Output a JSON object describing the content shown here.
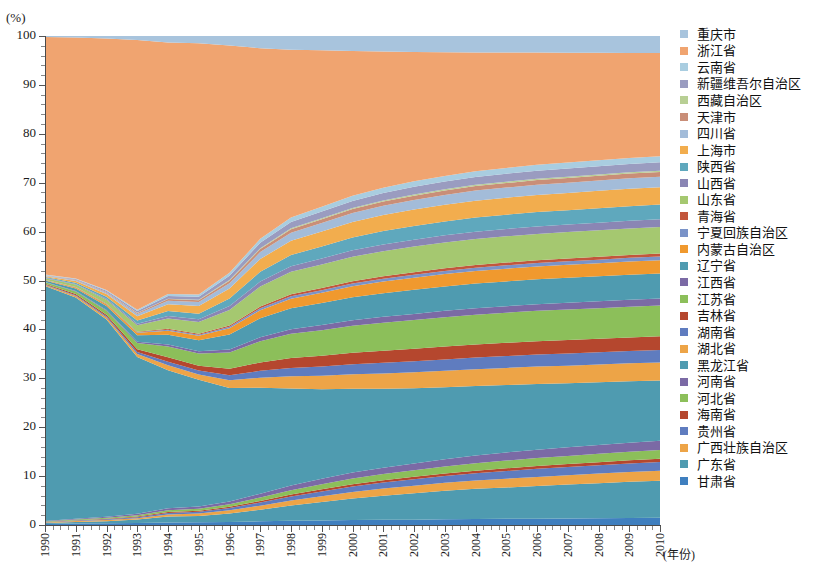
{
  "chart_data": {
    "type": "area",
    "title": "",
    "xlabel": "(年份)",
    "ylabel": "(%)",
    "ylim": [
      0,
      100
    ],
    "xlim": [
      1990,
      2010
    ],
    "ytick_labels": [
      "0",
      "10",
      "20",
      "30",
      "40",
      "50",
      "60",
      "70",
      "80",
      "90",
      "100"
    ],
    "ytick_values": [
      0,
      10,
      20,
      30,
      40,
      50,
      60,
      70,
      80,
      90,
      100
    ],
    "grid": false,
    "legend_position": "right",
    "stack_mode": "percent",
    "x": [
      1990,
      1991,
      1992,
      1993,
      1994,
      1995,
      1996,
      1997,
      1998,
      1999,
      2000,
      2001,
      2002,
      2003,
      2004,
      2005,
      2006,
      2007,
      2008,
      2009,
      2010
    ],
    "palette": [
      "#4f9bb0",
      "#7b6aa5",
      "#8cbf5a",
      "#b5472e",
      "#5f7cbf",
      "#eda447"
    ],
    "series": [
      {
        "name": "甘肃省",
        "values": [
          0.2,
          0.3,
          0.35,
          0.4,
          0.5,
          0.55,
          0.6,
          0.7,
          0.8,
          0.9,
          1.0,
          1.05,
          1.1,
          1.2,
          1.25,
          1.3,
          1.35,
          1.4,
          1.45,
          1.5,
          1.55
        ]
      },
      {
        "name": "广东省",
        "values": [
          0.2,
          0.3,
          0.4,
          0.7,
          1.2,
          1.3,
          1.7,
          2.2,
          2.9,
          3.6,
          4.3,
          4.9,
          5.4,
          5.9,
          6.3,
          6.6,
          6.9,
          7.2,
          7.5,
          7.8,
          8.0
        ]
      },
      {
        "name": "广西壮族自治区",
        "values": [
          0.1,
          0.2,
          0.25,
          0.3,
          0.45,
          0.5,
          0.6,
          0.75,
          0.95,
          1.1,
          1.3,
          1.45,
          1.55,
          1.65,
          1.75,
          1.85,
          1.95,
          2.0,
          2.05,
          2.1,
          2.15
        ]
      },
      {
        "name": "贵州省",
        "values": [
          0.05,
          0.1,
          0.15,
          0.2,
          0.3,
          0.35,
          0.45,
          0.6,
          0.8,
          0.95,
          1.1,
          1.2,
          1.3,
          1.4,
          1.5,
          1.6,
          1.7,
          1.75,
          1.8,
          1.85,
          1.9
        ]
      },
      {
        "name": "海南省",
        "values": [
          0.05,
          0.08,
          0.1,
          0.15,
          0.2,
          0.22,
          0.25,
          0.3,
          0.35,
          0.4,
          0.45,
          0.48,
          0.5,
          0.52,
          0.55,
          0.58,
          0.6,
          0.62,
          0.64,
          0.66,
          0.68
        ]
      },
      {
        "name": "河北省",
        "values": [
          0.1,
          0.15,
          0.2,
          0.25,
          0.35,
          0.4,
          0.5,
          0.65,
          0.85,
          1.0,
          1.15,
          1.25,
          1.35,
          1.45,
          1.55,
          1.65,
          1.7,
          1.75,
          1.8,
          1.85,
          1.9
        ]
      },
      {
        "name": "河南省",
        "values": [
          0.1,
          0.15,
          0.2,
          0.28,
          0.4,
          0.45,
          0.55,
          0.7,
          0.9,
          1.05,
          1.2,
          1.3,
          1.4,
          1.5,
          1.6,
          1.7,
          1.78,
          1.85,
          1.9,
          1.95,
          2.0
        ]
      },
      {
        "name": "黑龙江省",
        "values": [
          48.0,
          45.0,
          40.0,
          32.0,
          28.0,
          26.0,
          22.5,
          20.0,
          18.5,
          17.5,
          16.8,
          16.0,
          15.4,
          14.9,
          14.5,
          14.2,
          13.9,
          13.6,
          13.4,
          13.2,
          13.0
        ]
      },
      {
        "name": "湖北省",
        "values": [
          0.2,
          0.3,
          0.4,
          0.6,
          1.0,
          1.1,
          1.5,
          1.9,
          2.3,
          2.6,
          2.9,
          3.1,
          3.25,
          3.4,
          3.5,
          3.6,
          3.7,
          3.75,
          3.8,
          3.85,
          3.9
        ]
      },
      {
        "name": "湖南省",
        "values": [
          0.1,
          0.15,
          0.25,
          0.4,
          0.7,
          0.8,
          1.0,
          1.3,
          1.6,
          1.8,
          2.0,
          2.15,
          2.25,
          2.35,
          2.45,
          2.5,
          2.55,
          2.6,
          2.62,
          2.65,
          2.68
        ]
      },
      {
        "name": "吉林省",
        "values": [
          0.15,
          0.25,
          0.35,
          0.55,
          0.9,
          1.0,
          1.3,
          1.6,
          1.9,
          2.1,
          2.3,
          2.45,
          2.55,
          2.65,
          2.72,
          2.78,
          2.82,
          2.86,
          2.9,
          2.93,
          2.95
        ]
      },
      {
        "name": "江苏省",
        "values": [
          0.3,
          0.5,
          0.8,
          1.3,
          2.2,
          2.5,
          3.2,
          4.0,
          4.6,
          5.0,
          5.4,
          5.7,
          5.9,
          6.1,
          6.25,
          6.35,
          6.45,
          6.5,
          6.55,
          6.6,
          6.65
        ]
      },
      {
        "name": "江西省",
        "values": [
          0.05,
          0.1,
          0.15,
          0.25,
          0.4,
          0.45,
          0.6,
          0.75,
          0.9,
          1.0,
          1.1,
          1.18,
          1.24,
          1.3,
          1.35,
          1.38,
          1.42,
          1.45,
          1.47,
          1.49,
          1.5
        ]
      },
      {
        "name": "辽宁省",
        "values": [
          0.3,
          0.5,
          0.8,
          1.3,
          2.0,
          2.3,
          3.0,
          3.6,
          4.0,
          4.3,
          4.6,
          4.8,
          4.95,
          5.05,
          5.15,
          5.22,
          5.28,
          5.32,
          5.36,
          5.4,
          5.42
        ]
      },
      {
        "name": "内蒙古自治区",
        "values": [
          0.1,
          0.2,
          0.3,
          0.5,
          0.8,
          0.9,
          1.2,
          1.5,
          1.8,
          2.0,
          2.2,
          2.35,
          2.45,
          2.55,
          2.62,
          2.68,
          2.72,
          2.76,
          2.8,
          2.83,
          2.85
        ]
      },
      {
        "name": "宁夏回族自治区",
        "values": [
          0.03,
          0.05,
          0.08,
          0.12,
          0.2,
          0.22,
          0.3,
          0.38,
          0.45,
          0.5,
          0.55,
          0.58,
          0.62,
          0.65,
          0.68,
          0.7,
          0.72,
          0.74,
          0.76,
          0.78,
          0.8
        ]
      },
      {
        "name": "青海省",
        "values": [
          0.03,
          0.05,
          0.08,
          0.12,
          0.18,
          0.2,
          0.26,
          0.32,
          0.38,
          0.42,
          0.46,
          0.49,
          0.52,
          0.54,
          0.56,
          0.58,
          0.6,
          0.61,
          0.62,
          0.63,
          0.64
        ]
      },
      {
        "name": "山东省",
        "values": [
          0.3,
          0.5,
          0.8,
          1.3,
          2.1,
          2.4,
          3.1,
          3.8,
          4.3,
          4.6,
          4.9,
          5.1,
          5.25,
          5.35,
          5.45,
          5.52,
          5.58,
          5.62,
          5.66,
          5.7,
          5.72
        ]
      },
      {
        "name": "山西省",
        "values": [
          0.08,
          0.12,
          0.2,
          0.32,
          0.5,
          0.55,
          0.75,
          0.92,
          1.08,
          1.18,
          1.28,
          1.36,
          1.42,
          1.48,
          1.52,
          1.55,
          1.58,
          1.6,
          1.62,
          1.64,
          1.65
        ]
      },
      {
        "name": "陕西省",
        "values": [
          0.15,
          0.25,
          0.4,
          0.65,
          1.0,
          1.15,
          1.5,
          1.85,
          2.15,
          2.35,
          2.55,
          2.7,
          2.8,
          2.88,
          2.95,
          3.0,
          3.05,
          3.08,
          3.12,
          3.15,
          3.18
        ]
      },
      {
        "name": "上海市",
        "values": [
          0.2,
          0.35,
          0.55,
          0.9,
          1.4,
          1.6,
          2.0,
          2.4,
          2.7,
          2.9,
          3.1,
          3.25,
          3.35,
          3.45,
          3.52,
          3.58,
          3.62,
          3.66,
          3.7,
          3.73,
          3.75
        ]
      },
      {
        "name": "四川省",
        "values": [
          0.1,
          0.18,
          0.28,
          0.45,
          0.7,
          0.8,
          1.05,
          1.3,
          1.52,
          1.66,
          1.8,
          1.9,
          1.98,
          2.04,
          2.1,
          2.14,
          2.18,
          2.2,
          2.23,
          2.25,
          2.27
        ]
      },
      {
        "name": "天津市",
        "values": [
          0.05,
          0.08,
          0.13,
          0.2,
          0.32,
          0.36,
          0.48,
          0.58,
          0.68,
          0.74,
          0.8,
          0.85,
          0.88,
          0.91,
          0.94,
          0.96,
          0.98,
          0.99,
          1.0,
          1.01,
          1.02
        ]
      },
      {
        "name": "西藏自治区",
        "values": [
          0.02,
          0.03,
          0.04,
          0.06,
          0.09,
          0.1,
          0.13,
          0.16,
          0.18,
          0.2,
          0.22,
          0.23,
          0.24,
          0.25,
          0.26,
          0.27,
          0.27,
          0.28,
          0.28,
          0.29,
          0.29
        ]
      },
      {
        "name": "新疆维吾尔自治区",
        "values": [
          0.08,
          0.14,
          0.22,
          0.36,
          0.56,
          0.64,
          0.84,
          1.02,
          1.2,
          1.3,
          1.42,
          1.5,
          1.56,
          1.62,
          1.66,
          1.7,
          1.72,
          1.74,
          1.76,
          1.78,
          1.8
        ]
      },
      {
        "name": "云南省",
        "values": [
          0.06,
          0.1,
          0.16,
          0.26,
          0.4,
          0.46,
          0.6,
          0.74,
          0.86,
          0.94,
          1.02,
          1.08,
          1.12,
          1.16,
          1.2,
          1.22,
          1.24,
          1.26,
          1.28,
          1.29,
          1.3
        ]
      },
      {
        "name": "浙江省",
        "values": [
          48.5,
          49.0,
          51.0,
          55.0,
          51.0,
          51.5,
          45.0,
          36.0,
          32.0,
          30.5,
          29.0,
          27.6,
          26.5,
          25.6,
          24.8,
          24.3,
          23.8,
          23.4,
          23.0,
          22.6,
          22.3
        ]
      },
      {
        "name": "重庆市",
        "values": [
          0.2,
          0.3,
          0.5,
          0.8,
          1.3,
          1.5,
          1.9,
          2.3,
          2.6,
          2.8,
          3.0,
          3.15,
          3.25,
          3.35,
          3.42,
          3.48,
          3.52,
          3.56,
          3.6,
          3.63,
          3.65
        ]
      }
    ]
  },
  "axes": {
    "y_unit": "(%)",
    "x_title": "(年份)",
    "x_labels": [
      "1990",
      "1991",
      "1992",
      "1993",
      "1994",
      "1995",
      "1996",
      "1997",
      "1998",
      "1999",
      "2000",
      "2001",
      "2002",
      "2003",
      "2004",
      "2005",
      "2006",
      "2007",
      "2008",
      "2009",
      "2010"
    ],
    "y_labels": [
      "100",
      "90",
      "80",
      "70",
      "60",
      "50",
      "40",
      "30",
      "20",
      "10",
      "0"
    ]
  },
  "legend": {
    "items": [
      {
        "label": "重庆市",
        "color": "#a8c4dd"
      },
      {
        "label": "浙江省",
        "color": "#f0a470"
      },
      {
        "label": "云南省",
        "color": "#a9cde0"
      },
      {
        "label": "新疆维吾尔自治区",
        "color": "#9a9cc0"
      },
      {
        "label": "西藏自治区",
        "color": "#b8cf94"
      },
      {
        "label": "天津市",
        "color": "#c98e78"
      },
      {
        "label": "四川省",
        "color": "#a3bcd9"
      },
      {
        "label": "上海市",
        "color": "#f2ad4e"
      },
      {
        "label": "陕西省",
        "color": "#5fa8bd"
      },
      {
        "label": "山西省",
        "color": "#8a86b4"
      },
      {
        "label": "山东省",
        "color": "#a5c870"
      },
      {
        "label": "青海省",
        "color": "#c2563c"
      },
      {
        "label": "宁夏回族自治区",
        "color": "#7a93c8"
      },
      {
        "label": "内蒙古自治区",
        "color": "#f0992e"
      },
      {
        "label": "辽宁省",
        "color": "#4f9bb0"
      },
      {
        "label": "江西省",
        "color": "#7b6aa5"
      },
      {
        "label": "江苏省",
        "color": "#8cbf5a"
      },
      {
        "label": "吉林省",
        "color": "#b5472e"
      },
      {
        "label": "湖南省",
        "color": "#5f7cbf"
      },
      {
        "label": "湖北省",
        "color": "#eda447"
      },
      {
        "label": "黑龙江省",
        "color": "#4f9bb0"
      },
      {
        "label": "河南省",
        "color": "#7b6aa5"
      },
      {
        "label": "河北省",
        "color": "#8cbf5a"
      },
      {
        "label": "海南省",
        "color": "#b5472e"
      },
      {
        "label": "贵州省",
        "color": "#5f7cbf"
      },
      {
        "label": "广西壮族自治区",
        "color": "#eda447"
      },
      {
        "label": "广东省",
        "color": "#4f9bb0"
      },
      {
        "label": "甘肃省",
        "color": "#3f7fbf"
      }
    ]
  }
}
